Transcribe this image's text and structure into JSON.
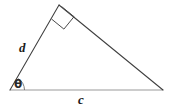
{
  "figure": {
    "type": "geometry-diagram",
    "background_color": "#ffffff",
    "stroke_color_dark": "#3f3f3f",
    "stroke_color_light": "#9a9a9a",
    "labels": {
      "left_side": "d",
      "base": "c",
      "angle": "θ"
    },
    "icons": {
      "right_angle": "right-angle-square",
      "angle_arc": "angle-arc"
    },
    "geometry": {
      "vertex_bottom_left": [
        10,
        90
      ],
      "vertex_apex": [
        59,
        5
      ],
      "vertex_bottom_right": [
        163,
        90
      ],
      "right_angle_at": "apex",
      "marked_angle_at": "vertex_bottom_left"
    }
  }
}
